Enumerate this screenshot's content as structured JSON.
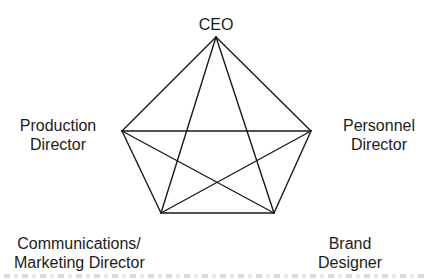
{
  "diagram": {
    "type": "all-channel communication network (pentagon, fully connected)",
    "nodes": [
      {
        "id": "ceo",
        "label_lines": [
          "CEO"
        ],
        "x": 216,
        "y": 37
      },
      {
        "id": "production",
        "label_lines": [
          "Production",
          "Director"
        ],
        "x": 122,
        "y": 131
      },
      {
        "id": "personnel",
        "label_lines": [
          "Personnel",
          "Director"
        ],
        "x": 311,
        "y": 131
      },
      {
        "id": "communications",
        "label_lines": [
          "Communications/",
          "Marketing Director"
        ],
        "x": 161,
        "y": 213
      },
      {
        "id": "brand",
        "label_lines": [
          "Brand",
          "Designer"
        ],
        "x": 274,
        "y": 213
      }
    ],
    "edges": [
      [
        "ceo",
        "production"
      ],
      [
        "ceo",
        "personnel"
      ],
      [
        "ceo",
        "communications"
      ],
      [
        "ceo",
        "brand"
      ],
      [
        "production",
        "personnel"
      ],
      [
        "production",
        "communications"
      ],
      [
        "production",
        "brand"
      ],
      [
        "personnel",
        "communications"
      ],
      [
        "personnel",
        "brand"
      ],
      [
        "communications",
        "brand"
      ]
    ],
    "line_color": "#1a1a1a"
  },
  "labels": {
    "ceo": {
      "line1": "CEO"
    },
    "production": {
      "line1": "Production",
      "line2": "Director"
    },
    "personnel": {
      "line1": "Personnel",
      "line2": "Director"
    },
    "communications": {
      "line1": "Communications/",
      "line2": "Marketing Director"
    },
    "brand": {
      "line1": "Brand",
      "line2": "Designer"
    }
  }
}
